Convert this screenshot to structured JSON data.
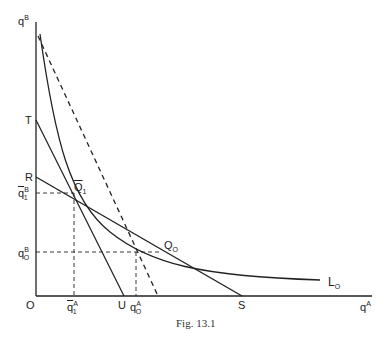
{
  "figure": {
    "caption": "Fig. 13.1",
    "axes": {
      "y_label": "q",
      "y_label_sup": "B",
      "x_label": "q",
      "x_label_sup": "A",
      "origin": "O"
    },
    "points": {
      "T": "T",
      "R": "R",
      "U": "U",
      "S": "S",
      "Q1": "Q",
      "Q1_sub": "1",
      "Q0": "Q",
      "Q0_sub": "O"
    },
    "ticks": {
      "q1B": "q",
      "q1B_sup": "B",
      "q1B_sub": "1",
      "q0B": "q",
      "q0B_sup": "B",
      "q0B_sub": "O",
      "q1A": "q",
      "q1A_sup": "A",
      "q1A_sub": "1",
      "q0A": "q",
      "q0A_sup": "A",
      "q0A_sub": "O"
    },
    "curve_label": "L",
    "curve_label_sub": "O"
  }
}
